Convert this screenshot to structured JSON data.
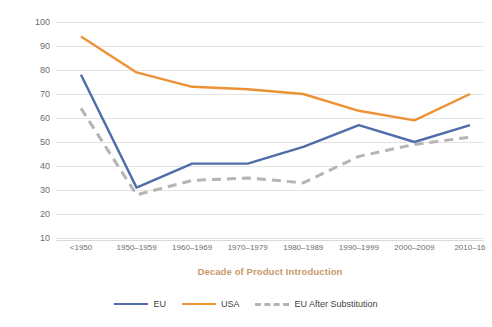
{
  "chart_data": {
    "type": "line",
    "title": "",
    "xlabel": "Decade of Product Introduction",
    "ylabel": "% of Active Ingredients Introduced",
    "categories": [
      "<1950",
      "1950–1959",
      "1960–1969",
      "1970–1979",
      "1980–1989",
      "1990–1999",
      "2000–2009",
      "2010–16"
    ],
    "series": [
      {
        "name": "EU",
        "color": "#4f6da8",
        "style": "solid",
        "values": [
          78,
          31,
          41,
          41,
          48,
          57,
          50,
          57
        ]
      },
      {
        "name": "USA",
        "color": "#ed9234",
        "style": "solid",
        "values": [
          94,
          79,
          73,
          72,
          70,
          63,
          59,
          70
        ]
      },
      {
        "name": "EU After Substitution",
        "color": "#b5b5b5",
        "style": "dashed",
        "values": [
          64,
          28,
          34,
          35,
          33,
          44,
          49,
          52
        ]
      }
    ],
    "ylim": [
      0,
      100
    ],
    "yticks": [
      10,
      20,
      30,
      40,
      50,
      60,
      70,
      80,
      90,
      100
    ],
    "ytick_labels": [
      "10",
      "20",
      "30",
      "40",
      "50",
      "60",
      "70",
      "80",
      "90",
      "100"
    ],
    "grid": "horizontal",
    "legend_position": "bottom",
    "axis_title_color": "#c8996b",
    "tick_color": "#6d6d6d",
    "grid_color": "#e4e4e4",
    "background": "#ffffff"
  }
}
